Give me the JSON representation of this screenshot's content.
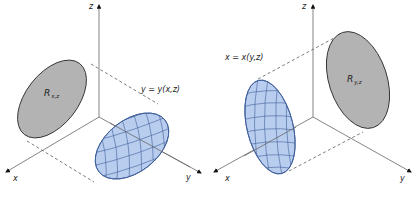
{
  "figures": [
    {
      "id": "left",
      "axes": {
        "z": "z",
        "x": "x",
        "y": "y"
      },
      "region_label": "R",
      "region_subscript": "x,z",
      "surface_label": "y = y(x,z)",
      "region_color": "#b3b3b3",
      "surface_color": "#b9cdee"
    },
    {
      "id": "right",
      "axes": {
        "z": "z",
        "x": "x",
        "y": "y"
      },
      "region_label": "R",
      "region_subscript": "y,z",
      "surface_label": "x = x(y,z)",
      "region_color": "#b3b3b3",
      "surface_color": "#b9cdee"
    }
  ]
}
